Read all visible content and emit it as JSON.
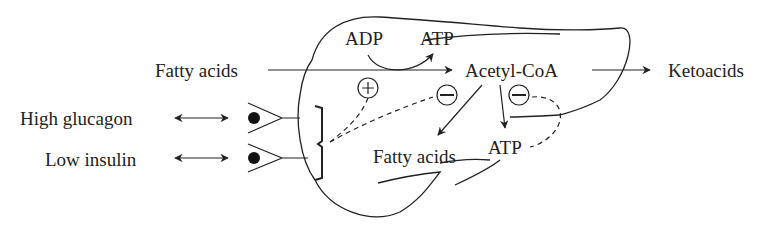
{
  "labels": {
    "fatty_acids_in": "Fatty acids",
    "adp": "ADP",
    "atp_top": "ATP",
    "acetyl_coa": "Acetyl-CoA",
    "ketoacids": "Ketoacids",
    "high_glucagon": "High glucagon",
    "low_insulin": "Low insulin",
    "fatty_acids_out": "Fatty acids",
    "atp_bottom": "ATP"
  },
  "symbols": {
    "plus": "+",
    "minus1": "−",
    "minus2": "−"
  },
  "colors": {
    "ink": "#222222",
    "background": "#ffffff"
  }
}
